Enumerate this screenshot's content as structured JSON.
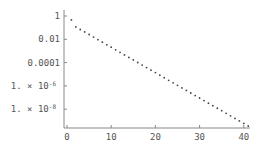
{
  "chart_data": {
    "type": "scatter",
    "title": "",
    "xlabel": "",
    "ylabel": "",
    "y_scale": "log",
    "x_ticks": [
      0,
      10,
      20,
      30,
      40
    ],
    "x_tick_labels": [
      "0",
      "10",
      "20",
      "30",
      "40"
    ],
    "y_ticks": [
      1,
      0.01,
      0.0001,
      1e-06,
      1e-08
    ],
    "y_tick_labels": [
      "1",
      "0.01",
      "0.0001",
      "1. × 10^-6",
      "1. × 10^-8"
    ],
    "xlim": [
      -0.5,
      42
    ],
    "ylim": [
      2.5e-10,
      2
    ],
    "grid": false,
    "legend": null,
    "series": [
      {
        "name": "points",
        "x": [
          1,
          2,
          3,
          4,
          5,
          6,
          7,
          8,
          9,
          10,
          11,
          12,
          13,
          14,
          15,
          16,
          17,
          18,
          19,
          20,
          21,
          22,
          23,
          24,
          25,
          26,
          27,
          28,
          29,
          30,
          31,
          32,
          33,
          34,
          35,
          36,
          37,
          38,
          39,
          40,
          41
        ],
        "log10_y": [
          -0.34,
          -0.94,
          -1.16,
          -1.37,
          -1.59,
          -1.81,
          -2.03,
          -2.25,
          -2.47,
          -2.68,
          -2.9,
          -3.12,
          -3.34,
          -3.56,
          -3.77,
          -3.99,
          -4.21,
          -4.43,
          -4.65,
          -4.86,
          -5.08,
          -5.3,
          -5.52,
          -5.74,
          -5.95,
          -6.17,
          -6.39,
          -6.61,
          -6.83,
          -7.04,
          -7.26,
          -7.48,
          -7.7,
          -7.92,
          -8.13,
          -8.35,
          -8.57,
          -8.79,
          -9.01,
          -9.22,
          -9.44
        ]
      }
    ]
  }
}
